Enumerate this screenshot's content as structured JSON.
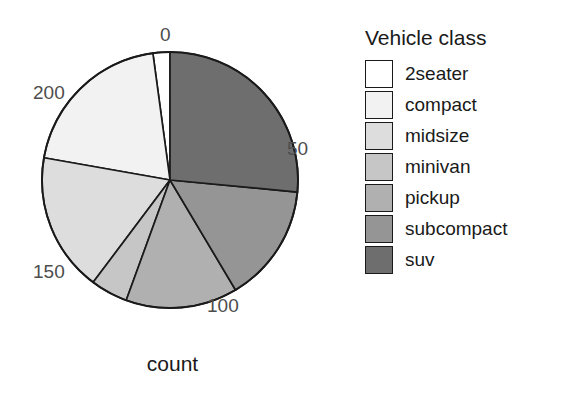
{
  "chart_data": {
    "type": "pie",
    "title": "",
    "subtitle": "",
    "xlabel": "",
    "ylabel": "count",
    "axis_title": "count",
    "legend_title": "Vehicle class",
    "legend_position": "right",
    "grid": false,
    "categories": [
      "2seater",
      "compact",
      "midsize",
      "minivan",
      "pickup",
      "subcompact",
      "suv"
    ],
    "values": [
      5,
      47,
      41,
      11,
      33,
      35,
      62
    ],
    "total": 234,
    "axis_ticks": [
      "0",
      "50",
      "100",
      "150",
      "200"
    ],
    "axis_tick_values": [
      0,
      50,
      100,
      150,
      200
    ],
    "axis_range": [
      0,
      234
    ],
    "colors": [
      "#ffffff",
      "#f2f2f2",
      "#dddddd",
      "#c6c6c6",
      "#b0b0b0",
      "#959595",
      "#6e6e6e"
    ],
    "stroke_color": "#1a1a1a",
    "slices": [
      {
        "label": "2seater",
        "value": 5,
        "color": "#ffffff",
        "start_deg": 352.3,
        "end_deg": 360.0
      },
      {
        "label": "compact",
        "value": 47,
        "color": "#f2f2f2",
        "start_deg": 280.0,
        "end_deg": 352.3
      },
      {
        "label": "midsize",
        "value": 41,
        "color": "#dddddd",
        "start_deg": 216.9,
        "end_deg": 280.0
      },
      {
        "label": "minivan",
        "value": 11,
        "color": "#c6c6c6",
        "start_deg": 200.0,
        "end_deg": 216.9
      },
      {
        "label": "pickup",
        "value": 33,
        "color": "#b0b0b0",
        "start_deg": 149.2,
        "end_deg": 200.0
      },
      {
        "label": "subcompact",
        "value": 35,
        "color": "#959595",
        "start_deg": 95.4,
        "end_deg": 149.2
      },
      {
        "label": "suv",
        "value": 62,
        "color": "#6e6e6e",
        "start_deg": 0.0,
        "end_deg": 95.4
      }
    ]
  },
  "plot": {
    "axis_title": "count",
    "ticks": [
      {
        "id": "tick-0",
        "label": "0"
      },
      {
        "id": "tick-50",
        "label": "50"
      },
      {
        "id": "tick-100",
        "label": "100"
      },
      {
        "id": "tick-150",
        "label": "150"
      },
      {
        "id": "tick-200",
        "label": "200"
      }
    ]
  },
  "legend": {
    "title": "Vehicle class",
    "items": [
      {
        "label": "2seater",
        "color": "#ffffff"
      },
      {
        "label": "compact",
        "color": "#f2f2f2"
      },
      {
        "label": "midsize",
        "color": "#dddddd"
      },
      {
        "label": "minivan",
        "color": "#c6c6c6"
      },
      {
        "label": "pickup",
        "color": "#b0b0b0"
      },
      {
        "label": "subcompact",
        "color": "#959595"
      },
      {
        "label": "suv",
        "color": "#6e6e6e"
      }
    ]
  }
}
